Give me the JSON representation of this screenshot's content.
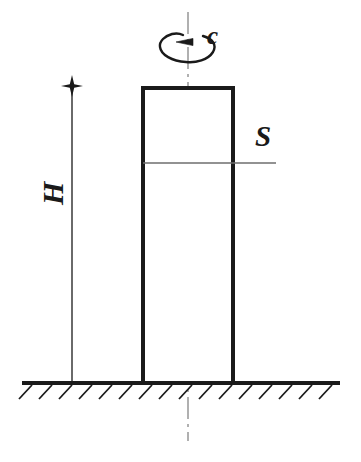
{
  "figure": {
    "type": "engineering-diagram",
    "background_color": "#ffffff",
    "line_color": "#1a1a1a",
    "centerline_color": "#9a9a9a",
    "thin_line_color": "#6e6e6e"
  },
  "labels": {
    "rotation": "c",
    "section": "S",
    "height": "H"
  },
  "geometry": {
    "column": {
      "x": 143,
      "y": 88,
      "width": 90,
      "height": 295,
      "stroke_width": 4
    },
    "ground_line": {
      "x1": 22,
      "y1": 383,
      "x2": 340,
      "y2": 383,
      "stroke_width": 4
    },
    "hatching": {
      "count": 16,
      "spacing": 20,
      "length": 18,
      "angle_deg": 45,
      "start_x": 32
    },
    "center_axis": {
      "x": 188,
      "y_top": 12,
      "y_bottom": 441,
      "dash_pattern": "dash-dot"
    },
    "dimension_line": {
      "x": 72,
      "y_top": 86,
      "y_bottom": 383
    },
    "dimension_marker": {
      "type": "star-cross",
      "x": 72,
      "y": 86,
      "size": 11
    },
    "section_line": {
      "x1": 143,
      "y1": 163,
      "x2": 276,
      "y2": 163
    },
    "rotation_arrow": {
      "ellipse_cx": 188,
      "ellipse_cy": 48,
      "ellipse_rx": 28,
      "ellipse_ry": 14,
      "arrowhead_x": 179,
      "arrowhead_y": 42,
      "direction": "counter-clockwise-left"
    }
  }
}
